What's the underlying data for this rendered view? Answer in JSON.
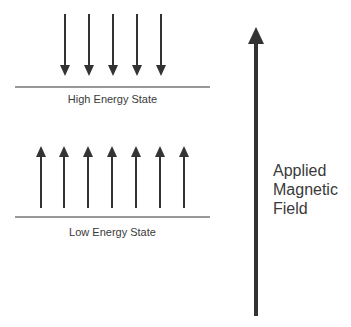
{
  "diagram": {
    "colors": {
      "stroke": "#333333",
      "text": "#3a3a3a",
      "background": "#ffffff"
    },
    "high_energy": {
      "label": "High Energy State",
      "arrow_direction": "down",
      "arrow_count": 5
    },
    "low_energy": {
      "label": "Low Energy State",
      "arrow_direction": "up",
      "arrow_count": 7
    },
    "field": {
      "label_lines": [
        "Applied",
        "Magnetic",
        "Field"
      ],
      "arrow_direction": "up"
    }
  }
}
